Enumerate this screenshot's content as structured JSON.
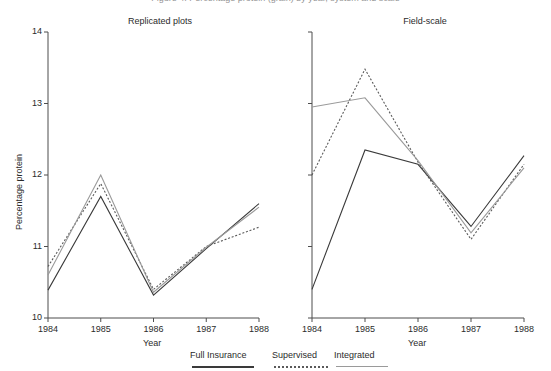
{
  "figure": {
    "cropped_top_text": "Figure 4. Percentage protein (grain) by year, system and scale",
    "y_axis_label": "Percentage protein",
    "x_axis_label": "Year",
    "y_ticks": [
      "10",
      "11",
      "12",
      "13",
      "14"
    ],
    "x_ticks": [
      "1984",
      "1985",
      "1986",
      "1987",
      "1988"
    ],
    "panels": [
      {
        "title": "Replicated plots"
      },
      {
        "title": "Field-scale"
      }
    ],
    "legend": {
      "items": [
        {
          "label": "Full Insurance",
          "style": "solid-dark",
          "color": "#3a3a3a"
        },
        {
          "label": "Supervised",
          "style": "dotted",
          "color": "#5a5a5a"
        },
        {
          "label": "Integrated",
          "style": "solid-light",
          "color": "#9a9a9a"
        }
      ]
    }
  },
  "chart_data": [
    {
      "type": "line",
      "title": "Replicated plots",
      "xlabel": "Year",
      "ylabel": "Percentage protein",
      "categories": [
        "1984",
        "1985",
        "1986",
        "1987",
        "1988"
      ],
      "x": [
        1984,
        1985,
        1986,
        1987,
        1988
      ],
      "ylim": [
        10,
        14
      ],
      "xlim": [
        1984,
        1988
      ],
      "grid": false,
      "legend_position": "bottom-center-shared",
      "series": [
        {
          "name": "Full Insurance",
          "style": "solid-dark",
          "color": "#3a3a3a",
          "values": [
            10.39,
            11.7,
            10.32,
            10.97,
            11.6
          ]
        },
        {
          "name": "Supervised",
          "style": "dotted",
          "color": "#5a5a5a",
          "values": [
            10.72,
            11.88,
            10.4,
            11.0,
            11.27
          ]
        },
        {
          "name": "Integrated",
          "style": "solid-light",
          "color": "#9a9a9a",
          "values": [
            10.6,
            12.0,
            10.36,
            10.99,
            11.55
          ]
        }
      ]
    },
    {
      "type": "line",
      "title": "Field-scale",
      "xlabel": "Year",
      "ylabel": "Percentage protein",
      "categories": [
        "1984",
        "1985",
        "1986",
        "1987",
        "1988"
      ],
      "x": [
        1984,
        1985,
        1986,
        1987,
        1988
      ],
      "ylim": [
        10,
        14
      ],
      "xlim": [
        1984,
        1988
      ],
      "grid": false,
      "legend_position": "bottom-center-shared",
      "series": [
        {
          "name": "Full Insurance",
          "style": "solid-dark",
          "color": "#3a3a3a",
          "values": [
            10.4,
            12.35,
            12.15,
            11.28,
            12.27
          ]
        },
        {
          "name": "Supervised",
          "style": "dotted",
          "color": "#5a5a5a",
          "values": [
            12.0,
            13.48,
            12.18,
            11.1,
            12.15
          ]
        },
        {
          "name": "Integrated",
          "style": "solid-light",
          "color": "#9a9a9a",
          "values": [
            12.95,
            13.08,
            12.2,
            11.19,
            12.1
          ]
        }
      ]
    }
  ]
}
